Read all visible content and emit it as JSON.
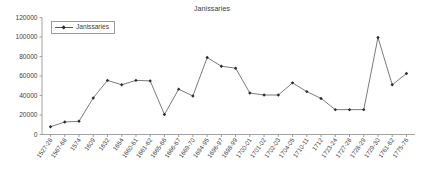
{
  "chart_data": {
    "type": "line",
    "title": "Janissaries",
    "xlabel": "",
    "ylabel": "",
    "ylim": [
      0,
      120000
    ],
    "ytick_values": [
      0,
      20000,
      40000,
      60000,
      80000,
      100000,
      120000
    ],
    "ytick_labels": [
      "0",
      "20000",
      "40000",
      "60000",
      "80000",
      "100000",
      "120000"
    ],
    "grid": false,
    "legend_position": "top-left",
    "legend_entries": [
      "Janissaries"
    ],
    "marker": "diamond",
    "line_color": "#595959",
    "marker_color": "#2b2b2b",
    "categories": [
      "1527-28",
      "1567-68",
      "1574",
      "1609",
      "1632",
      "1654",
      "1660-61",
      "1661-62",
      "1665-66",
      "1666-67",
      "1669-70",
      "1694-95",
      "1696-97",
      "1698-99",
      "1700-01",
      "1701-02",
      "1702-03",
      "1704-05",
      "1710-11",
      "1712",
      "1723-24",
      "1727-28",
      "1728-29",
      "1729-30",
      "1761-62",
      "1775-76"
    ],
    "series": [
      {
        "name": "Janissaries",
        "values": [
          8000,
          12800,
          13600,
          37500,
          55500,
          51000,
          55500,
          55000,
          20500,
          46500,
          39500,
          79000,
          70000,
          68000,
          42500,
          40500,
          40500,
          53000,
          44000,
          37000,
          25500,
          25500,
          25500,
          99500,
          51000,
          62500
        ]
      }
    ]
  }
}
